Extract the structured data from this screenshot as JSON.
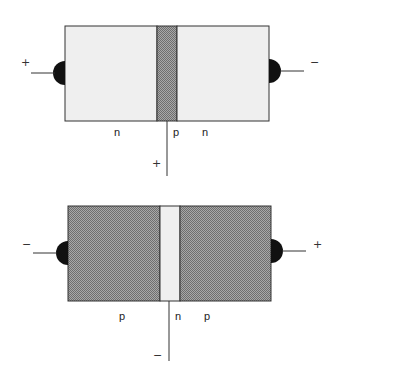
{
  "colors": {
    "light_region": "#efefef",
    "dark_region": "#8c8c8c",
    "outline": "#333333",
    "contact": "#111111"
  },
  "diagrams": [
    {
      "name": "npn-transistor",
      "left_terminal_sign": "+",
      "right_terminal_sign": "−",
      "base_terminal_sign": "+",
      "region_labels": [
        "n",
        "p",
        "n"
      ]
    },
    {
      "name": "pnp-transistor",
      "left_terminal_sign": "−",
      "right_terminal_sign": "+",
      "base_terminal_sign": "−",
      "region_labels": [
        "p",
        "n",
        "p"
      ]
    }
  ]
}
